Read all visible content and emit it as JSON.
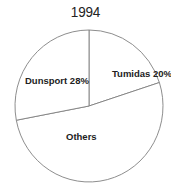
{
  "chart_data": {
    "type": "pie",
    "title": "1994",
    "slices": [
      {
        "label": "Tumidas",
        "value": 20,
        "display": "Tumidas 20%"
      },
      {
        "label": "Others",
        "value": 52,
        "display": "Others"
      },
      {
        "label": "Dunsport",
        "value": 28,
        "display": "Dunsport 28%"
      }
    ],
    "start_angle_deg": 0,
    "direction": "clockwise",
    "legend": "none",
    "colors": {
      "fill": "#ffffff",
      "stroke": "#808080",
      "text": "#222222"
    }
  }
}
